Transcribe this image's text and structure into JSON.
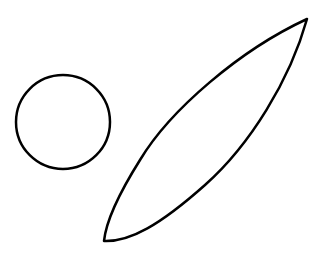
{
  "canvas": {
    "width": 329,
    "height": 280,
    "background": "#ffffff"
  },
  "shapes": [
    {
      "kind": "circle",
      "name": "circle",
      "cx": 63,
      "cy": 122,
      "r": 47,
      "stroke": "#000000",
      "stroke_width": 2.5,
      "fill": "none"
    },
    {
      "kind": "leaf",
      "name": "leaf",
      "tip_a": [
        104,
        241
      ],
      "tip_b": [
        307,
        19
      ],
      "stroke": "#000000",
      "stroke_width": 2.5,
      "fill": "none"
    }
  ]
}
